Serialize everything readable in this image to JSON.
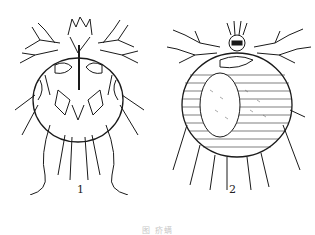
{
  "figure": {
    "panels": [
      {
        "id": "1",
        "label": "1",
        "subject": "mite-ventral-view"
      },
      {
        "id": "2",
        "label": "2",
        "subject": "mite-dorsal-view"
      }
    ],
    "caption": "图 疥螨"
  }
}
